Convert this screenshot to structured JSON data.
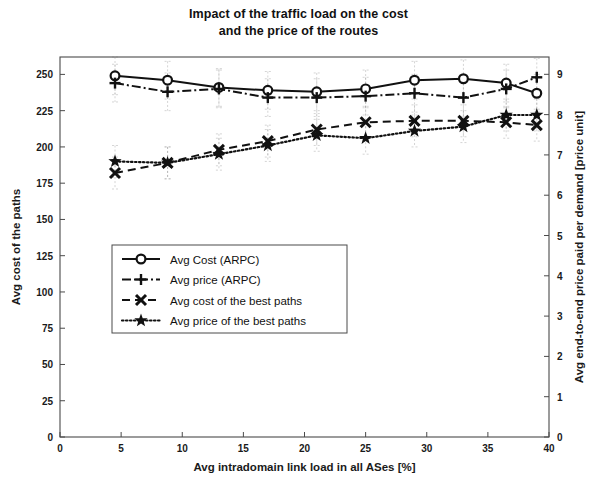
{
  "title": {
    "line1": "Impact of the traffic load on the cost",
    "line2": "and the price of the routes"
  },
  "axes": {
    "x_label": "Avg intradomain link load in all ASes [%]",
    "y_left_label": "Avg cost of the paths",
    "y_right_label": "Avg end-to-end price paid per demand [price unit]",
    "x_ticks": [
      "0",
      "5",
      "10",
      "15",
      "20",
      "25",
      "30",
      "35",
      "40"
    ],
    "y_left_ticks": [
      "0",
      "25",
      "50",
      "75",
      "100",
      "125",
      "150",
      "175",
      "200",
      "225",
      "250"
    ],
    "y_right_ticks": [
      "0",
      "1",
      "2",
      "3",
      "4",
      "5",
      "6",
      "7",
      "8",
      "9"
    ]
  },
  "legend": {
    "items": [
      {
        "label": "Avg Cost (ARPC)",
        "marker": "circle-marker",
        "style": "solid"
      },
      {
        "label": "Avg  price (ARPC)",
        "marker": "plus-marker",
        "style": "dashdot"
      },
      {
        "label": "Avg cost of the best paths",
        "marker": "cross-marker",
        "style": "dashed"
      },
      {
        "label": "Avg price of the best paths",
        "marker": "star-marker",
        "style": "dotted"
      }
    ]
  },
  "chart_data": {
    "type": "line",
    "title": "Impact of the traffic load on the cost and the price of the routes",
    "xlabel": "Avg intradomain link load in all ASes [%]",
    "ylabel": "Avg cost of the paths",
    "ylabel_right": "Avg end-to-end price paid per demand [price unit]",
    "xlim": [
      0,
      40
    ],
    "ylim": [
      0,
      262
    ],
    "ylim_right": [
      0,
      9.43
    ],
    "grid": false,
    "legend_position": "center-left",
    "x": [
      4.5,
      8.8,
      13.0,
      17.0,
      21.0,
      25.0,
      29.0,
      33.0,
      36.5,
      39.0
    ],
    "series": [
      {
        "name": "Avg Cost (ARPC)",
        "axis": "left",
        "marker": "circle",
        "style": "solid",
        "values": [
          249,
          246,
          241,
          239,
          238,
          240,
          246,
          247,
          244,
          237
        ]
      },
      {
        "name": "Avg  price (ARPC)",
        "axis": "left",
        "marker": "plus",
        "style": "dashdot",
        "values": [
          244,
          238,
          240,
          234,
          234,
          235,
          237,
          234,
          240,
          248
        ]
      },
      {
        "name": "Avg cost of the best paths",
        "axis": "left",
        "marker": "cross",
        "style": "dashed",
        "values": [
          182,
          189,
          198,
          204,
          212,
          217,
          218,
          218,
          217,
          215
        ]
      },
      {
        "name": "Avg price of the best paths",
        "axis": "left",
        "marker": "star",
        "style": "dotted",
        "values": [
          190,
          189,
          195,
          201,
          208,
          206,
          211,
          214,
          222,
          222
        ]
      }
    ]
  }
}
